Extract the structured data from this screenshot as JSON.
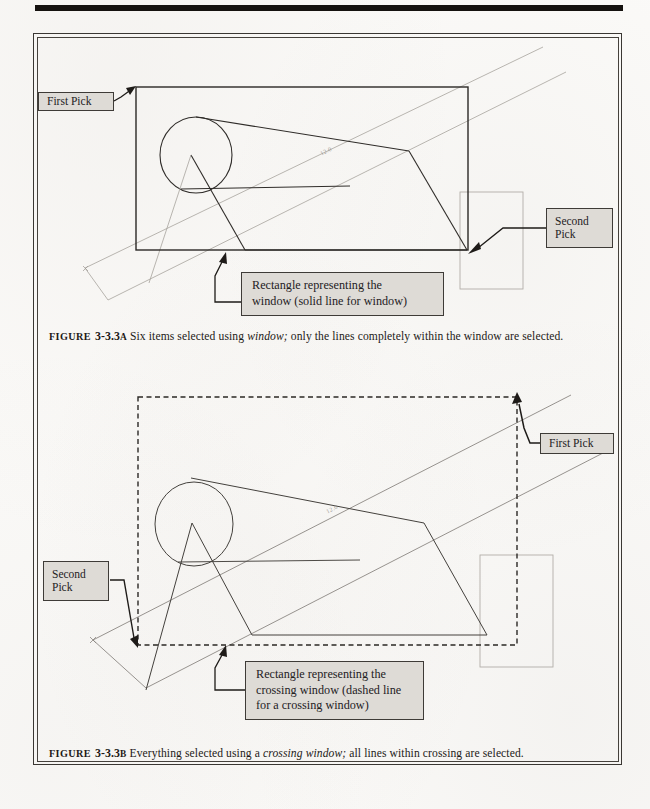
{
  "page": {
    "background_color": "#fbfaf8",
    "frame_color": "#3a3733",
    "rule_color": "#15120f"
  },
  "figures": [
    {
      "id": "figure-a",
      "callouts": {
        "first_pick": "First Pick",
        "second_pick_line1": "Second",
        "second_pick_line2": "Pick",
        "window_desc_line1": "Rectangle representing the",
        "window_desc_line2": "window (solid line for window)"
      },
      "selection_box": {
        "style": "solid",
        "color": "#2b2825",
        "label": "window"
      },
      "dim_text": "12.0",
      "caption": {
        "figure_word": "FIGURE",
        "number": "3-3.3",
        "suffix": "A",
        "text_before_emph": " Six items selected using ",
        "emph": "window;",
        "text_after_emph": " only the lines completely within the window are selected."
      }
    },
    {
      "id": "figure-b",
      "callouts": {
        "first_pick": "First Pick",
        "second_pick_line1": "Second",
        "second_pick_line2": "Pick",
        "window_desc_line1": "Rectangle representing the",
        "window_desc_line2": "crossing window (dashed line",
        "window_desc_line3": "for a crossing window)"
      },
      "selection_box": {
        "style": "dashed",
        "color": "#2b2825",
        "label": "crossing window"
      },
      "dim_text": "12.0",
      "caption": {
        "figure_word": "FIGURE",
        "number": "3-3.3",
        "suffix": "B",
        "text_before_emph": " Everything selected using a ",
        "emph": "crossing window;",
        "text_after_emph": " all lines within crossing are selected."
      }
    }
  ]
}
